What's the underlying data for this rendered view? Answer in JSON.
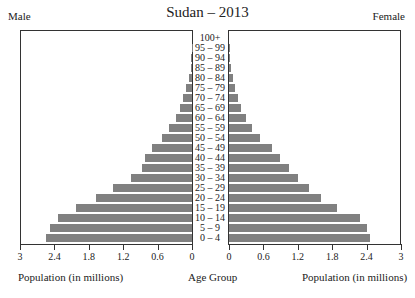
{
  "chart_data": {
    "type": "bar",
    "subtype": "population-pyramid",
    "title": "Sudan – 2013",
    "left_label": "Male",
    "right_label": "Female",
    "xlabel_left": "Population (in millions)",
    "xlabel_center": "Age Group",
    "xlabel_right": "Population (in millions)",
    "xlim": [
      0,
      3
    ],
    "left_ticks": [
      "3",
      "2.4",
      "1.8",
      "1.2",
      "0.6",
      "0"
    ],
    "right_ticks": [
      "0",
      "0.6",
      "1.2",
      "1.8",
      "2.4",
      "3"
    ],
    "categories": [
      "100+",
      "95 – 99",
      "90 – 94",
      "85 – 89",
      "80 – 84",
      "75 – 79",
      "70 – 74",
      "65 – 69",
      "60 – 64",
      "55 – 59",
      "50 – 54",
      "45 – 49",
      "40 – 44",
      "35 – 39",
      "30 – 34",
      "25 – 29",
      "20 – 24",
      "15 – 19",
      "10 – 14",
      "5 – 9",
      "0 – 4"
    ],
    "series": [
      {
        "name": "Male",
        "color": "#808080",
        "values": [
          0.0,
          0.003,
          0.01,
          0.02,
          0.06,
          0.1,
          0.16,
          0.21,
          0.28,
          0.4,
          0.52,
          0.7,
          0.82,
          0.87,
          1.06,
          1.38,
          1.68,
          2.02,
          2.34,
          2.48,
          2.55
        ]
      },
      {
        "name": "Female",
        "color": "#808080",
        "values": [
          0.0,
          0.003,
          0.01,
          0.03,
          0.07,
          0.11,
          0.16,
          0.21,
          0.3,
          0.4,
          0.54,
          0.75,
          0.89,
          1.05,
          1.21,
          1.39,
          1.6,
          1.89,
          2.28,
          2.4,
          2.46
        ]
      }
    ],
    "grid": false,
    "legend": "none"
  }
}
